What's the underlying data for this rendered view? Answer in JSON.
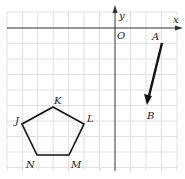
{
  "diagram": {
    "type": "coordinate-grid",
    "axes": {
      "x_label": "x",
      "y_label": "y",
      "origin_label": "O"
    },
    "grid": {
      "color": "#d9d9d9",
      "columns": 11,
      "rows": 10
    },
    "vector": {
      "start_label": "A",
      "end_label": "B",
      "color": "#111111"
    },
    "pentagon": {
      "vertex_labels": [
        "J",
        "K",
        "L",
        "M",
        "N"
      ],
      "color": "#111111"
    }
  }
}
